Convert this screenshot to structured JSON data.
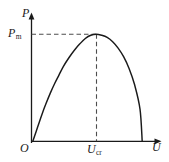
{
  "figure": {
    "kind": "power-voltage-curve",
    "background_color": "#ffffff",
    "stroke_color": "#1a1a1a",
    "dash_color": "#4d4d4d"
  },
  "labels": {
    "y_axis": "P",
    "y_axis_name": "P",
    "peak_value_base": "P",
    "peak_value_sub": "m",
    "origin": "O",
    "critical_base": "U",
    "critical_sub": "cr",
    "x_axis": "U"
  },
  "chart_data": {
    "type": "line",
    "title": "",
    "subtitle": "",
    "xlabel": "U",
    "ylabel": "P",
    "grid": false,
    "legend": false,
    "xlim": [
      0,
      1.18
    ],
    "ylim": [
      0,
      1.12
    ],
    "x_ticks": [
      {
        "value": 0,
        "label": "O"
      },
      {
        "value": 0.58,
        "label": "U_cr"
      }
    ],
    "y_ticks": [
      {
        "value": 1.0,
        "label": "P_m"
      }
    ],
    "annotations": [
      {
        "type": "dashed-horizontal",
        "from": [
          0,
          1.0
        ],
        "to": [
          0.58,
          1.0
        ],
        "label": "P_m level"
      },
      {
        "type": "dashed-vertical",
        "from": [
          0.58,
          0
        ],
        "to": [
          0.58,
          1.0
        ],
        "label": "U_cr position"
      },
      {
        "type": "peak-marker",
        "at": [
          0.58,
          1.0
        ],
        "label": "maximum power point"
      }
    ],
    "series": [
      {
        "name": "P(U)",
        "x": [
          0.0,
          0.03,
          0.06,
          0.09,
          0.12,
          0.16,
          0.2,
          0.24,
          0.28,
          0.33,
          0.38,
          0.43,
          0.48,
          0.53,
          0.58,
          0.63,
          0.68,
          0.73,
          0.78,
          0.83,
          0.88,
          0.93,
          0.98,
          1.0
        ],
        "y": [
          0.0,
          0.09,
          0.18,
          0.27,
          0.35,
          0.45,
          0.54,
          0.62,
          0.7,
          0.78,
          0.85,
          0.91,
          0.96,
          0.99,
          1.0,
          0.99,
          0.97,
          0.93,
          0.87,
          0.79,
          0.68,
          0.53,
          0.3,
          0.0
        ]
      }
    ]
  }
}
